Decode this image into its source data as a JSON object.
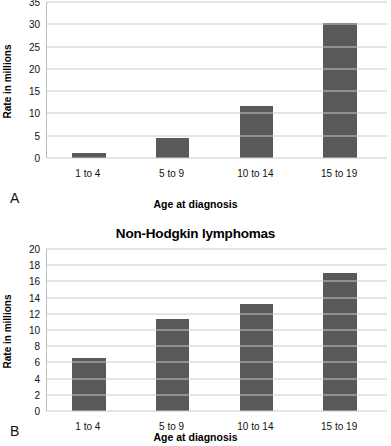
{
  "figure": {
    "panels": [
      {
        "letter": "A",
        "title": "Hodgkin lymphomas",
        "title_visible": false,
        "chart_data": {
          "type": "bar",
          "title": "Hodgkin lymphomas",
          "categories": [
            "1 to 4",
            "5 to 9",
            "10 to 14",
            "15 to 19"
          ],
          "values": [
            1.1,
            4.4,
            11.6,
            30.4
          ],
          "xlabel": "Age at diagnosis",
          "ylabel": "Rate in millions",
          "ylim": [
            0,
            35
          ],
          "yticks": [
            0,
            5,
            10,
            15,
            20,
            25,
            30,
            35
          ],
          "grid": true,
          "legend": "none",
          "bar_color": "#595959"
        }
      },
      {
        "letter": "B",
        "title": "Non-Hodgkin lymphomas",
        "title_visible": true,
        "chart_data": {
          "type": "bar",
          "title": "Non-Hodgkin lymphomas",
          "categories": [
            "1 to 4",
            "5 to 9",
            "10 to 14",
            "15 to 19"
          ],
          "values": [
            6.6,
            11.3,
            13.2,
            17.0
          ],
          "xlabel": "Age at diagnosis",
          "ylabel": "Rate in millions",
          "ylim": [
            0,
            20
          ],
          "yticks": [
            0,
            2,
            4,
            6,
            8,
            10,
            12,
            14,
            16,
            18,
            20
          ],
          "grid": true,
          "legend": "none",
          "bar_color": "#595959"
        }
      }
    ]
  }
}
